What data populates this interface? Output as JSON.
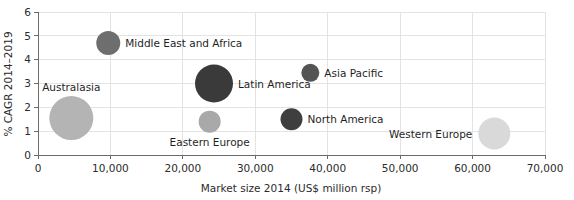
{
  "chart_data": {
    "type": "scatter",
    "title": "",
    "xlabel": "Market size 2014 (US$ million rsp)",
    "ylabel": "% CAGR 2014–2019",
    "xlim": [
      0,
      70000
    ],
    "ylim": [
      0,
      6
    ],
    "xticks": [
      "0",
      "10,000",
      "20,000",
      "30,000",
      "40,000",
      "50,000",
      "60,000",
      "70,000"
    ],
    "xtick_values": [
      0,
      10000,
      20000,
      30000,
      40000,
      50000,
      60000,
      70000
    ],
    "yticks": [
      "0",
      "1",
      "2",
      "3",
      "4",
      "5",
      "6"
    ],
    "ytick_values": [
      0,
      1,
      2,
      3,
      4,
      5,
      6
    ],
    "grid": true,
    "legend": "none",
    "size_encoding": "bubble area",
    "points": [
      {
        "label": "Middle East and Africa",
        "x": 9700,
        "y": 4.7,
        "size": 12,
        "color": "#6e6e6e",
        "label_side": "right"
      },
      {
        "label": "Latin America",
        "x": 24300,
        "y": 3.0,
        "size": 19,
        "color": "#3a3a3a",
        "label_side": "right"
      },
      {
        "label": "Asia Pacific",
        "x": 37600,
        "y": 3.45,
        "size": 9,
        "color": "#545454",
        "label_side": "right"
      },
      {
        "label": "North America",
        "x": 35000,
        "y": 1.5,
        "size": 11,
        "color": "#3f3f3f",
        "label_side": "right"
      },
      {
        "label": "Eastern Europe",
        "x": 23700,
        "y": 1.4,
        "size": 11,
        "color": "#a9a9a9",
        "label_side": "below"
      },
      {
        "label": "Australasia",
        "x": 4600,
        "y": 1.55,
        "size": 22,
        "color": "#b4b4b4",
        "label_side": "above"
      },
      {
        "label": "Western Europe",
        "x": 63000,
        "y": 0.9,
        "size": 16,
        "color": "#d9d9d9",
        "label_side": "left"
      }
    ]
  },
  "colors": {
    "background": "#ffffff",
    "grid": "#e3e3e3",
    "axis": "#6b6b6b",
    "text": "#2b2b2b"
  }
}
